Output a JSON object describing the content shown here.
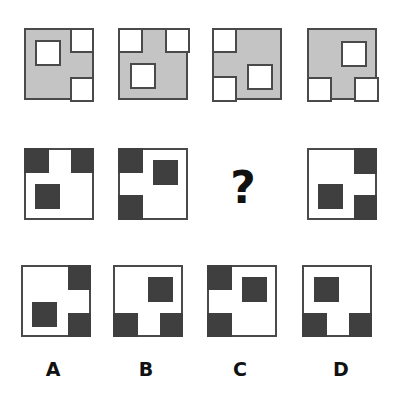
{
  "puzzle": {
    "question_mark": "?",
    "colors": {
      "gray_fill": "#c4c4c4",
      "dark_fill": "#3f3f3f",
      "border": "#4a4a4a",
      "white": "#ffffff"
    },
    "row1": [
      {
        "fill": "gray",
        "holes": [
          "top-right-corner",
          "bottom-right-corner",
          "inner-top-left"
        ]
      },
      {
        "fill": "gray",
        "holes": [
          "top-left-corner",
          "top-right-corner",
          "inner-bottom-left"
        ]
      },
      {
        "fill": "gray",
        "holes": [
          "top-left-corner",
          "bottom-left-corner",
          "inner-bottom-right"
        ]
      },
      {
        "fill": "gray",
        "holes": [
          "bottom-left-corner",
          "bottom-right-corner",
          "inner-top-right"
        ]
      }
    ],
    "row2": [
      {
        "fill": "white",
        "blocks": [
          "top-left-corner",
          "top-right-corner",
          "inner-bottom-left"
        ]
      },
      {
        "fill": "white",
        "blocks": [
          "top-left-corner",
          "bottom-left-corner",
          "inner-top-right"
        ]
      },
      {
        "missing": true
      },
      {
        "fill": "white",
        "blocks": [
          "top-right-corner",
          "bottom-right-corner",
          "inner-bottom-left"
        ]
      }
    ],
    "options": [
      {
        "label": "A",
        "blocks": [
          "top-right-corner",
          "bottom-right-corner",
          "inner-bottom-left"
        ]
      },
      {
        "label": "B",
        "blocks": [
          "bottom-left-corner",
          "bottom-right-corner",
          "inner-top-right"
        ]
      },
      {
        "label": "C",
        "blocks": [
          "top-left-corner",
          "bottom-left-corner",
          "inner-top-right"
        ]
      },
      {
        "label": "D",
        "blocks": [
          "bottom-left-corner",
          "bottom-right-corner",
          "inner-top-left"
        ]
      }
    ]
  }
}
